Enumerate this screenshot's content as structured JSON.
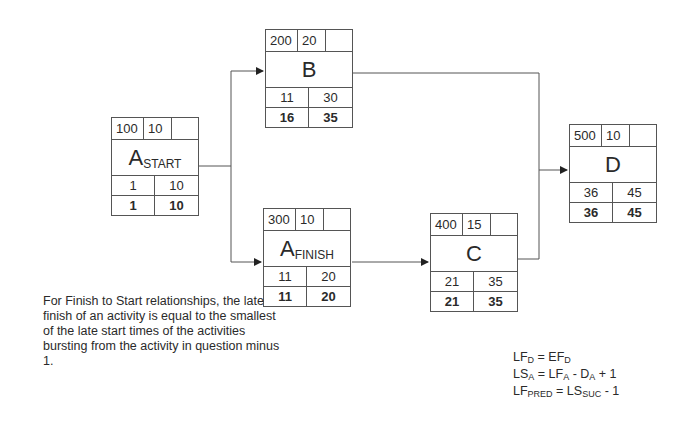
{
  "nodes": [
    {
      "id": "a_start",
      "name": "A",
      "subscript": "START",
      "code": "100",
      "duration": "10",
      "extra": "",
      "es": "1",
      "ef": "10",
      "ls": "1",
      "lf": "10"
    },
    {
      "id": "b",
      "name": "B",
      "subscript": "",
      "code": "200",
      "duration": "20",
      "extra": "",
      "es": "11",
      "ef": "30",
      "ls": "16",
      "lf": "35"
    },
    {
      "id": "a_finish",
      "name": "A",
      "subscript": "FINISH",
      "code": "300",
      "duration": "10",
      "extra": "",
      "es": "11",
      "ef": "20",
      "ls": "11",
      "lf": "20"
    },
    {
      "id": "c",
      "name": "C",
      "subscript": "",
      "code": "400",
      "duration": "15",
      "extra": "",
      "es": "21",
      "ef": "35",
      "ls": "21",
      "lf": "35"
    },
    {
      "id": "d",
      "name": "D",
      "subscript": "",
      "code": "500",
      "duration": "10",
      "extra": "",
      "es": "36",
      "ef": "45",
      "ls": "36",
      "lf": "45"
    }
  ],
  "edges": [
    {
      "from": "a_start",
      "to": "b"
    },
    {
      "from": "a_start",
      "to": "a_finish"
    },
    {
      "from": "a_finish",
      "to": "c"
    },
    {
      "from": "b",
      "to": "d"
    },
    {
      "from": "c",
      "to": "d"
    }
  ],
  "note": "For Finish to Start relationships, the late finish of an activity is equal to the smallest of the late start times of the activities bursting from the activity in question minus 1.",
  "formulas": [
    {
      "lhs": "LF",
      "lhs_sub": "D",
      "rhs": "= EF",
      "rhs_sub": "D",
      "tail": ""
    },
    {
      "lhs": "LS",
      "lhs_sub": "A",
      "rhs": "= LF",
      "rhs_sub": "A",
      "tail": " - D",
      "tail_sub": "A",
      "end": " + 1"
    },
    {
      "lhs": "LF",
      "lhs_sub": "PRED",
      "rhs": " = LS",
      "rhs_sub": "SUC",
      "tail": " - 1"
    }
  ]
}
